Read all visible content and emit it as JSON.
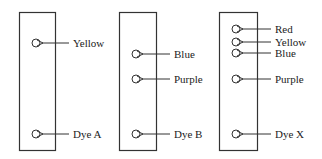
{
  "diagram": {
    "type": "paper chromatography",
    "colors": {
      "stroke": "#333333",
      "text": "#222222",
      "background": "#ffffff"
    },
    "strips": [
      {
        "id": "A",
        "rect": {
          "x": 19,
          "y": 12,
          "w": 36,
          "h": 138
        },
        "spots": [
          {
            "label": "Yellow",
            "cy": 43
          },
          {
            "label": "Dye A",
            "cy": 134
          }
        ]
      },
      {
        "id": "B",
        "rect": {
          "x": 119,
          "y": 12,
          "w": 37,
          "h": 138
        },
        "spots": [
          {
            "label": "Blue",
            "cy": 54
          },
          {
            "label": "Purple",
            "cy": 79
          },
          {
            "label": "Dye B",
            "cy": 134
          }
        ]
      },
      {
        "id": "X",
        "rect": {
          "x": 219,
          "y": 12,
          "w": 38,
          "h": 138
        },
        "spots": [
          {
            "label": "Red",
            "cy": 29
          },
          {
            "label": "Yellow",
            "cy": 42
          },
          {
            "label": "Blue",
            "cy": 53
          },
          {
            "label": "Purple",
            "cy": 79
          },
          {
            "label": "Dye X",
            "cy": 134
          }
        ]
      }
    ]
  }
}
